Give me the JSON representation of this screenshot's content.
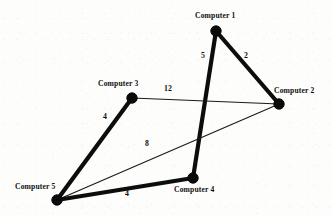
{
  "chart_data": {
    "type": "diagram",
    "title": "",
    "subtitle": "",
    "xlabel": "",
    "ylabel": "",
    "graph_kind": "weighted-undirected-network",
    "nodes": [
      {
        "id": "computer-1",
        "label": "Computer 1",
        "x": 216,
        "y": 31,
        "label_x": 195,
        "label_y": 12
      },
      {
        "id": "computer-2",
        "label": "Computer 2",
        "x": 279,
        "y": 104,
        "label_x": 274,
        "label_y": 87
      },
      {
        "id": "computer-3",
        "label": "Computer 3",
        "x": 132,
        "y": 98,
        "label_x": 98,
        "label_y": 80
      },
      {
        "id": "computer-4",
        "label": "Computer 4",
        "x": 193,
        "y": 178,
        "label_x": 174,
        "label_y": 186
      },
      {
        "id": "computer-5",
        "label": "Computer 5",
        "x": 57,
        "y": 200,
        "label_x": 15,
        "label_y": 183
      }
    ],
    "edges": [
      {
        "id": "edge-c1-c4",
        "from": "computer-1",
        "to": "computer-4",
        "weight": 5,
        "style": "thick",
        "label_x": 201,
        "label_y": 52
      },
      {
        "id": "edge-c1-c2",
        "from": "computer-1",
        "to": "computer-2",
        "weight": 2,
        "style": "thick",
        "label_x": 244,
        "label_y": 52
      },
      {
        "id": "edge-c3-c2",
        "from": "computer-3",
        "to": "computer-2",
        "weight": 12,
        "style": "thin",
        "label_x": 164,
        "label_y": 85
      },
      {
        "id": "edge-c3-c5",
        "from": "computer-3",
        "to": "computer-5",
        "weight": 4,
        "style": "thick",
        "label_x": 103,
        "label_y": 113
      },
      {
        "id": "edge-c5-c2",
        "from": "computer-5",
        "to": "computer-2",
        "weight": 8,
        "style": "thin",
        "label_x": 145,
        "label_y": 140
      },
      {
        "id": "edge-c5-c4",
        "from": "computer-5",
        "to": "computer-4",
        "weight": 4,
        "style": "thick",
        "label_x": 125,
        "label_y": 190
      }
    ],
    "node_radius": 5.2,
    "colors": {
      "background": "#fdfdfc",
      "node": "#0a0a0a",
      "edge_thick": "#0d0d0d",
      "edge_thin": "#1a1a1a",
      "text": "#101010"
    },
    "legend": [],
    "annotations": []
  }
}
